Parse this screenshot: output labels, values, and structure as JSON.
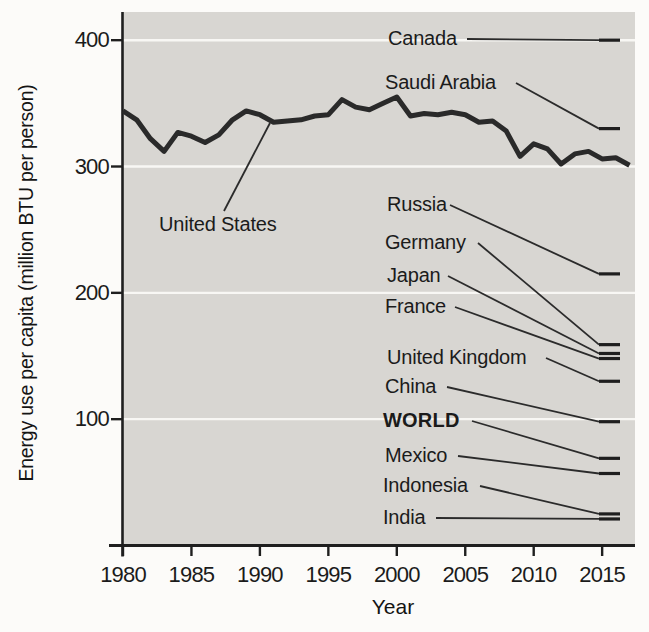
{
  "chart_data": {
    "type": "line",
    "title": "",
    "xlabel": "Year",
    "ylabel": "Energy use per capita (million BTU per person)",
    "x_ticks": [
      "1980",
      "1985",
      "1990",
      "1995",
      "2000",
      "2005",
      "2010",
      "2015"
    ],
    "y_ticks": [
      "100",
      "200",
      "300",
      "400"
    ],
    "xlim": [
      1980,
      2017.5
    ],
    "ylim": [
      0,
      425
    ],
    "grid": "horizontal white gridlines at 100, 200, 300, 400",
    "legend_position": "none (direct labels with leader lines)",
    "series": [
      {
        "name": "United States",
        "x_start": 1980,
        "x_end": 2017,
        "values": [
          344,
          337,
          322,
          312,
          327,
          324,
          319,
          325,
          337,
          344,
          341,
          335,
          336,
          337,
          340,
          341,
          353,
          347,
          345,
          350,
          355,
          340,
          342,
          341,
          343,
          341,
          335,
          336,
          328,
          308,
          318,
          314,
          302,
          310,
          312,
          306,
          307,
          301
        ]
      }
    ],
    "right_edge_markers": [
      {
        "label": "Canada",
        "value": 400,
        "bold": false
      },
      {
        "label": "Saudi Arabia",
        "value": 330,
        "bold": false
      },
      {
        "label": "Russia",
        "value": 215,
        "bold": false
      },
      {
        "label": "Germany",
        "value": 159,
        "bold": false
      },
      {
        "label": "Japan",
        "value": 152,
        "bold": false
      },
      {
        "label": "France",
        "value": 148,
        "bold": false
      },
      {
        "label": "United Kingdom",
        "value": 130,
        "bold": false
      },
      {
        "label": "China",
        "value": 98,
        "bold": false
      },
      {
        "label": "WORLD",
        "value": 69,
        "bold": true
      },
      {
        "label": "Mexico",
        "value": 57,
        "bold": false
      },
      {
        "label": "Indonesia",
        "value": 25,
        "bold": false
      },
      {
        "label": "India",
        "value": 21,
        "bold": false
      }
    ]
  },
  "colors": {
    "plot_background": "#d8d6d2",
    "line": "#2a2a2a",
    "gridline": "#f8f7f4",
    "axis": "#1f1f1f",
    "leader": "#2b2b2b",
    "text": "#1b1b1b"
  }
}
